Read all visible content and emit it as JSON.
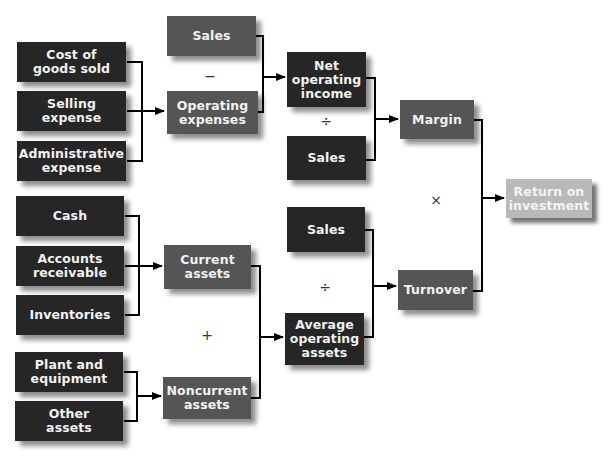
{
  "diagram": {
    "colors": {
      "input_box": "#262626",
      "intermediate_box": "#555555",
      "result_box": "#b9b9b9",
      "connector": "#000000"
    },
    "nodes": {
      "cost_of_goods_sold": "Cost of\ngoods sold",
      "selling_expense": "Selling\nexpense",
      "administrative_expense": "Administrative\nexpense",
      "sales_top": "Sales",
      "operating_expenses": "Operating\nexpenses",
      "net_operating_income": "Net\noperating\nincome",
      "sales_mid": "Sales",
      "margin": "Margin",
      "return_on_investment": "Return on\ninvestment",
      "cash": "Cash",
      "accounts_receivable": "Accounts\nreceivable",
      "inventories": "Inventories",
      "current_assets": "Current\nassets",
      "plant_and_equipment": "Plant and\nequipment",
      "other_assets": "Other\nassets",
      "noncurrent_assets": "Noncurrent\nassets",
      "sales_lower": "Sales",
      "average_operating_assets": "Average\noperating\nassets",
      "turnover": "Turnover"
    },
    "operators": {
      "minus": "−",
      "divide_margin": "÷",
      "multiply": "×",
      "divide_turnover": "÷",
      "plus": "+"
    },
    "edges": [
      {
        "from": [
          "cost_of_goods_sold",
          "selling_expense",
          "administrative_expense"
        ],
        "to": "operating_expenses"
      },
      {
        "from": [
          "sales_top",
          "operating_expenses"
        ],
        "op": "minus",
        "to": "net_operating_income"
      },
      {
        "from": [
          "net_operating_income",
          "sales_mid"
        ],
        "op": "divide",
        "to": "margin"
      },
      {
        "from": [
          "cash",
          "accounts_receivable",
          "inventories"
        ],
        "to": "current_assets"
      },
      {
        "from": [
          "plant_and_equipment",
          "other_assets"
        ],
        "to": "noncurrent_assets"
      },
      {
        "from": [
          "current_assets",
          "noncurrent_assets"
        ],
        "op": "plus",
        "to": "average_operating_assets"
      },
      {
        "from": [
          "sales_lower",
          "average_operating_assets"
        ],
        "op": "divide",
        "to": "turnover"
      },
      {
        "from": [
          "margin",
          "turnover"
        ],
        "op": "multiply",
        "to": "return_on_investment"
      }
    ]
  }
}
